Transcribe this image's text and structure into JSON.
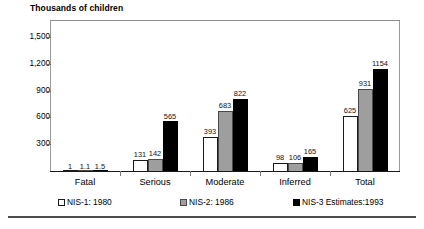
{
  "chart_data": {
    "type": "bar",
    "title": "Thousands of children",
    "xlabel": "",
    "ylabel": "",
    "ylim": [
      0,
      1700
    ],
    "yticks": [
      300,
      600,
      900,
      1200,
      1500
    ],
    "ytick_labels": [
      "300",
      "600",
      "900",
      "1,200",
      "1,500"
    ],
    "grid": false,
    "legend_position": "bottom",
    "categories": [
      "Fatal",
      "Serious",
      "Moderate",
      "Inferred",
      "Total"
    ],
    "series": [
      {
        "name": "NIS-1: 1980",
        "color": "#ffffff",
        "values": [
          1,
          131,
          393,
          98,
          625
        ],
        "labels": [
          "1",
          "131",
          "393",
          "98",
          "625"
        ]
      },
      {
        "name": "NIS-2: 1986",
        "color": "#9e9e9e",
        "values": [
          1.1,
          142,
          683,
          106,
          931
        ],
        "labels": [
          "1.1",
          "142",
          "683",
          "106",
          "931"
        ]
      },
      {
        "name": "NIS-3 Estimates:1993",
        "color": "#000000",
        "values": [
          1.5,
          565,
          822,
          165,
          1154
        ],
        "labels": [
          "1.5",
          "565",
          "822",
          "165",
          "1154"
        ]
      }
    ]
  },
  "legend": {
    "items": [
      {
        "label": "NIS-1: 1980",
        "swatch": "white-square-icon"
      },
      {
        "label": "NIS-2: 1986",
        "swatch": "gray-square-icon"
      },
      {
        "label": "NIS-3 Estimates:1993",
        "swatch": "black-square-icon"
      }
    ]
  }
}
